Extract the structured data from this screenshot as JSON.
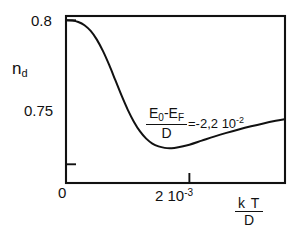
{
  "chart_data": {
    "type": "line",
    "title": "",
    "xlabel": "k T / D",
    "ylabel": "n_d",
    "xlim": [
      0,
      0.00355
    ],
    "ylim": [
      0.7435,
      0.8015
    ],
    "grid": false,
    "legend": null,
    "x_tick_labels": [
      "0",
      "2 10^-3"
    ],
    "x_tick_values": [
      0,
      0.002
    ],
    "y_tick_labels": [
      "0.8",
      "0.75"
    ],
    "y_tick_values": [
      0.8,
      0.75
    ],
    "annotations": [
      {
        "text": "(E_0 - E_F) / D = -2,2 10^-2",
        "numerator": "E0-EF",
        "denominator": "D",
        "value": "-2,2 10^-2"
      }
    ],
    "series": [
      {
        "name": "n_d",
        "x": [
          0.0,
          0.0001,
          0.0002,
          0.0003,
          0.0004,
          0.0005,
          0.0006,
          0.0007,
          0.0008,
          0.0009,
          0.001,
          0.0011,
          0.0012,
          0.0013,
          0.0014,
          0.0015,
          0.0016,
          0.0017,
          0.0018,
          0.002,
          0.0022,
          0.0024,
          0.0026,
          0.0028,
          0.003,
          0.0032,
          0.0034,
          0.00355
        ],
        "y": [
          0.8,
          0.7999,
          0.7994,
          0.7983,
          0.7963,
          0.7933,
          0.7893,
          0.7845,
          0.7792,
          0.7739,
          0.769,
          0.7648,
          0.7614,
          0.7589,
          0.7572,
          0.7562,
          0.7557,
          0.7556,
          0.7558,
          0.7568,
          0.7582,
          0.7596,
          0.7609,
          0.7621,
          0.7632,
          0.7642,
          0.7651,
          0.7657
        ]
      }
    ]
  },
  "axes": {
    "y_label": {
      "base": "n",
      "sub": "d"
    },
    "y_ticks": [
      {
        "label": "0.8"
      },
      {
        "label": "0.75"
      }
    ],
    "x_ticks": [
      {
        "label": "0"
      },
      {
        "mantissa": "2 10",
        "exponent": "-3"
      }
    ],
    "x_title": {
      "numerator": "k T",
      "denominator": "D"
    }
  },
  "annotation": {
    "num_e0": "E",
    "num_e0_sub": "0",
    "num_minus": "-",
    "num_ef": "E",
    "num_ef_sub": "F",
    "denominator": "D",
    "equals": "=-2,2 10",
    "exponent": "-2"
  },
  "style": {
    "curve_color": "#111111",
    "frame_color": "#111111",
    "background": "#ffffff"
  }
}
